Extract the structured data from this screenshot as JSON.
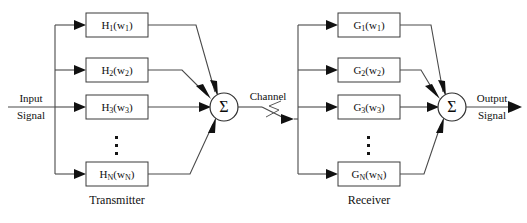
{
  "diagram": {
    "background_color": "#ffffff",
    "line_color": "#4a4a4a",
    "text_color": "#101010"
  },
  "input": {
    "line1": "Input",
    "line2": "Signal"
  },
  "output": {
    "line1": "Output",
    "line2": "Signal"
  },
  "channel": {
    "label": "Channel",
    "icon": "zigzag-channel-icon"
  },
  "transmitter": {
    "section_label": "Transmitter",
    "sum_symbol": "Σ",
    "ellipsis": "⋮",
    "blocks": [
      {
        "base": "H",
        "index": "1",
        "arg_base": "w",
        "arg_index": "1",
        "full": "H1(w1)"
      },
      {
        "base": "H",
        "index": "2",
        "arg_base": "w",
        "arg_index": "2",
        "full": "H2(w2)"
      },
      {
        "base": "H",
        "index": "3",
        "arg_base": "w",
        "arg_index": "3",
        "full": "H3(w3)"
      },
      {
        "base": "H",
        "index": "N",
        "arg_base": "w",
        "arg_index": "N",
        "full": "HN(wN)"
      }
    ]
  },
  "receiver": {
    "section_label": "Receiver",
    "sum_symbol": "Σ",
    "ellipsis": "⋮",
    "blocks": [
      {
        "base": "G",
        "index": "1",
        "arg_base": "w",
        "arg_index": "1",
        "full": "G1(w1)"
      },
      {
        "base": "G",
        "index": "2",
        "arg_base": "w",
        "arg_index": "2",
        "full": "G2(w2)"
      },
      {
        "base": "G",
        "index": "3",
        "arg_base": "w",
        "arg_index": "3",
        "full": "G3(w3)"
      },
      {
        "base": "G",
        "index": "N",
        "arg_base": "w",
        "arg_index": "N",
        "full": "GN(wN)"
      }
    ]
  }
}
